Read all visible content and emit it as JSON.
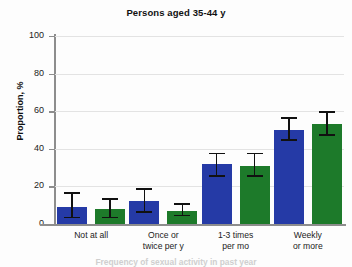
{
  "chart_data": {
    "type": "bar",
    "title": "Persons aged 35-44 y",
    "xlabel": "Frequency of sexual activity in past year",
    "ylabel": "Proportion, %",
    "ylim": [
      0,
      100
    ],
    "yticks": [
      0,
      20,
      40,
      60,
      80,
      100
    ],
    "ytick_labels": [
      "0",
      "20",
      "40",
      "60",
      "80",
      "100"
    ],
    "grid": true,
    "legend": "none",
    "categories": [
      "Not at all",
      "Once or twice per y",
      "1-3 times per mo",
      "Weekly or more"
    ],
    "category_lines": [
      [
        "Not at all",
        ""
      ],
      [
        "Once or",
        "twice per y"
      ],
      [
        "1-3 times",
        "per mo"
      ],
      [
        "Weekly",
        "or more"
      ]
    ],
    "series": [
      {
        "name": "Series 1",
        "color": "#253aa6",
        "values": [
          9,
          12,
          32,
          50
        ],
        "err_low": [
          3,
          6,
          25,
          44
        ],
        "err_high": [
          17,
          19,
          38,
          57
        ]
      },
      {
        "name": "Series 2",
        "color": "#1d7a2a",
        "values": [
          8,
          7,
          31,
          53
        ],
        "err_low": [
          3,
          4,
          25,
          47
        ],
        "err_high": [
          14,
          11,
          38,
          60
        ]
      }
    ]
  },
  "colors": {
    "series_1": "#253aa6",
    "series_2": "#1d7a2a",
    "axis": "#8d8d8d",
    "grid": "#e3e3e3",
    "error_bar": "#111111",
    "background": "#fdfdfd"
  }
}
